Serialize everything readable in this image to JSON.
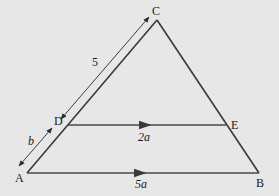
{
  "diagram": {
    "type": "geometry-triangle",
    "background": "#e7e7e7",
    "line_color": "#3a3a3a",
    "vertices": {
      "A": {
        "label": "A",
        "x": 27,
        "y": 173
      },
      "B": {
        "label": "B",
        "x": 259,
        "y": 173
      },
      "C": {
        "label": "C",
        "x": 157,
        "y": 20
      },
      "D": {
        "label": "D",
        "x": 68,
        "y": 125
      },
      "E": {
        "label": "E",
        "x": 226,
        "y": 125
      }
    },
    "segments": [
      {
        "from": "A",
        "to": "B",
        "label": "5a",
        "arrow": "mid"
      },
      {
        "from": "D",
        "to": "E",
        "label": "2a",
        "arrow": "mid"
      },
      {
        "from": "A",
        "to": "C"
      },
      {
        "from": "C",
        "to": "B"
      }
    ],
    "dimensions": [
      {
        "from": "C",
        "to": "D",
        "label": "5"
      },
      {
        "from": "D",
        "to": "A",
        "label": "b"
      }
    ],
    "labels": {
      "A": "A",
      "B": "B",
      "C": "C",
      "D": "D",
      "E": "E",
      "CD": "5",
      "DA": "b",
      "DE": "2a",
      "AB": "5a"
    }
  }
}
